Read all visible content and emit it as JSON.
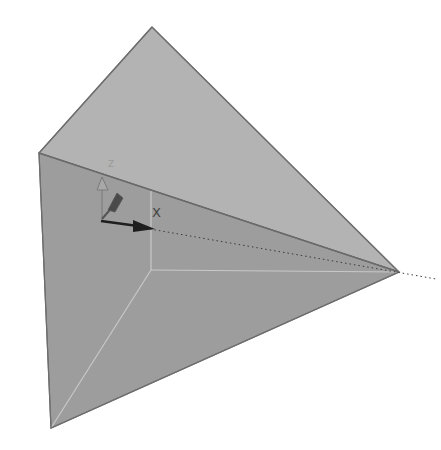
{
  "viewport": {
    "background": "#ffffff",
    "object": "tetrahedron-solid",
    "vertices": {
      "apex_top": [
        152,
        27
      ],
      "left": [
        39,
        153
      ],
      "right": [
        399,
        272
      ],
      "bottom": [
        51,
        428
      ],
      "hidden_inner": [
        151,
        270
      ]
    },
    "colors": {
      "top_face": "#b3b3b3",
      "front_face": "#9d9d9d",
      "edge": "#6e6e6e",
      "hidden_edge": "#c8c8c8",
      "axis_dark": "#1e1e1e",
      "axis_mid": "#555555",
      "axis_light": "#8a8a8a"
    }
  },
  "triad": {
    "origin": [
      101,
      221
    ],
    "labels": {
      "x": "X",
      "z": "Z"
    }
  }
}
